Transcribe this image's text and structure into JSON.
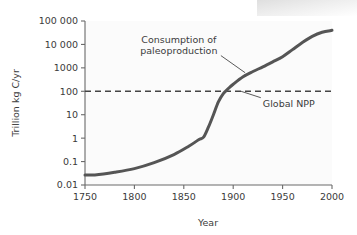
{
  "figure": {
    "background_color": "#ffffff",
    "plot_background_color": "#fbfbfb",
    "series_color": "#555555",
    "reference_line_color": "#444444",
    "axis_color": "#6a6a6a",
    "text_color": "#3b3b3b"
  },
  "chart_data": {
    "type": "line",
    "title": "",
    "xlabel": "Year",
    "ylabel": "Trillion kg C/yr",
    "xlim": [
      1750,
      2000
    ],
    "ylim": [
      0.01,
      100000
    ],
    "yscale": "log",
    "xscale": "linear",
    "grid": false,
    "legend": "none",
    "xticks": [
      1750,
      1800,
      1850,
      1900,
      1950,
      2000
    ],
    "xtick_labels": [
      "1750",
      "1800",
      "1850",
      "1900",
      "1950",
      "2000"
    ],
    "yticks": [
      0.01,
      0.1,
      1,
      10,
      100,
      1000,
      10000,
      100000
    ],
    "ytick_labels": [
      "0.01",
      "0.1",
      "1",
      "10",
      "100",
      "1000",
      "10 000",
      "100 000"
    ],
    "series": [
      {
        "name": "Consumption of paleoproduction",
        "x": [
          1750,
          1760,
          1780,
          1800,
          1820,
          1840,
          1855,
          1865,
          1870,
          1875,
          1880,
          1885,
          1890,
          1895,
          1900,
          1910,
          1920,
          1930,
          1940,
          1950,
          1960,
          1970,
          1980,
          1990,
          2000
        ],
        "y": [
          0.027,
          0.027,
          0.035,
          0.05,
          0.09,
          0.2,
          0.45,
          0.85,
          1.1,
          3,
          10,
          35,
          80,
          130,
          200,
          420,
          700,
          1100,
          1800,
          3000,
          6000,
          12000,
          22000,
          33000,
          40000
        ]
      }
    ],
    "reference_lines": [
      {
        "name": "Global NPP",
        "orientation": "horizontal",
        "value": 100,
        "style": "dashed",
        "label": "Global NPP"
      }
    ],
    "annotations": [
      {
        "name": "consumption-of-paleoproduction",
        "text_lines": [
          "Consumption of",
          "paleoproduction"
        ],
        "text_x": 1845,
        "text_y": 12000,
        "target_x": 1912,
        "target_y": 620
      },
      {
        "name": "global-npp",
        "text_lines": [
          "Global NPP"
        ],
        "text_x": 1930,
        "text_y": 22,
        "target_x": 1908,
        "target_y": 100
      }
    ]
  }
}
